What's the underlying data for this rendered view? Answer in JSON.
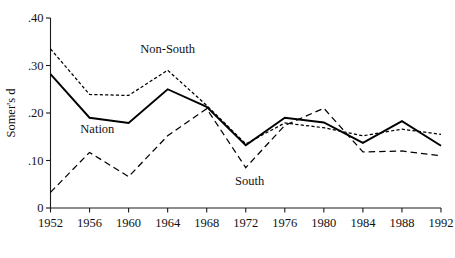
{
  "chart_data": {
    "type": "line",
    "title": "",
    "xlabel": "",
    "ylabel": "Somer's d",
    "x": [
      1952,
      1956,
      1960,
      1964,
      1968,
      1972,
      1976,
      1980,
      1984,
      1988,
      1992
    ],
    "xticklabels": [
      "1952",
      "1956",
      "1960",
      "1964",
      "1968",
      "1972",
      "1976",
      "1980",
      "1984",
      "1988",
      "1992"
    ],
    "yticklabels": [
      "0",
      ".10",
      ".20",
      ".30",
      ".40"
    ],
    "ytickvalues": [
      0,
      0.1,
      0.2,
      0.3,
      0.4
    ],
    "xlim": [
      1952,
      1992
    ],
    "ylim": [
      0,
      0.4
    ],
    "grid": false,
    "legend_position": "inline-annotations",
    "series": [
      {
        "name": "Non-South",
        "style": "dotted",
        "values": [
          0.335,
          0.239,
          0.237,
          0.29,
          0.216,
          0.135,
          0.179,
          0.169,
          0.152,
          0.166,
          0.155
        ]
      },
      {
        "name": "Nation",
        "style": "solid",
        "values": [
          0.282,
          0.19,
          0.179,
          0.25,
          0.213,
          0.132,
          0.19,
          0.18,
          0.137,
          0.183,
          0.131
        ]
      },
      {
        "name": "South",
        "style": "dashed",
        "values": [
          0.033,
          0.117,
          0.066,
          0.152,
          0.209,
          0.085,
          0.174,
          0.21,
          0.118,
          0.12,
          0.11
        ]
      }
    ],
    "annotations": [
      {
        "text": "Non-South",
        "x": 1964,
        "y": 0.326
      },
      {
        "text": "Nation",
        "x": 1956.8,
        "y": 0.157
      },
      {
        "text": "South",
        "x": 1972.4,
        "y": 0.048
      }
    ]
  }
}
